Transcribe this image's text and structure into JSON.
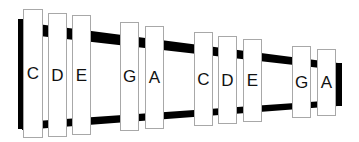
{
  "diagram": {
    "colors": {
      "rail": "#000000",
      "bar_fill": "#ffffff",
      "bar_border": "#a8a8a8",
      "label": "#111111"
    },
    "bars": [
      {
        "note": "C",
        "x": 23,
        "y": 9,
        "w": 20,
        "h": 129
      },
      {
        "note": "D",
        "x": 48,
        "y": 13,
        "w": 19,
        "h": 124
      },
      {
        "note": "E",
        "x": 72,
        "y": 15,
        "w": 19,
        "h": 120
      },
      {
        "note": "G",
        "x": 120,
        "y": 22,
        "w": 19,
        "h": 109
      },
      {
        "note": "A",
        "x": 145,
        "y": 26,
        "w": 19,
        "h": 103
      },
      {
        "note": "C",
        "x": 194,
        "y": 32,
        "w": 19,
        "h": 94
      },
      {
        "note": "D",
        "x": 218,
        "y": 36,
        "w": 19,
        "h": 88
      },
      {
        "note": "E",
        "x": 243,
        "y": 39,
        "w": 19,
        "h": 83
      },
      {
        "note": "G",
        "x": 292,
        "y": 46,
        "w": 19,
        "h": 72
      },
      {
        "note": "A",
        "x": 317,
        "y": 49,
        "w": 19,
        "h": 67
      }
    ]
  }
}
